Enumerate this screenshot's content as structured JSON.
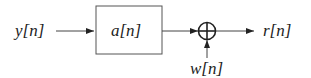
{
  "diagram": {
    "input_label": "y[n]",
    "block_label": "a[n]",
    "noise_label": "w[n]",
    "output_label": "r[n]",
    "summer_symbol": "+",
    "colors": {
      "line": "#333333",
      "box_fill": "#ffffff",
      "text": "#222222"
    }
  }
}
